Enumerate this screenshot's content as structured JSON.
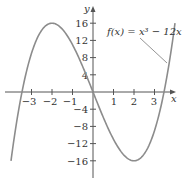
{
  "chart_data": {
    "type": "line",
    "title": "",
    "function_label": "f(x) = x³ − 12x",
    "xlabel": "x",
    "ylabel": "y",
    "xlim": [
      -4.0,
      4.0
    ],
    "ylim": [
      -16,
      16
    ],
    "x_ticks": [
      -3,
      -2,
      -1,
      1,
      2,
      3
    ],
    "y_ticks": [
      -16,
      -12,
      -8,
      -4,
      4,
      8,
      12,
      16
    ],
    "grid": false,
    "series": [
      {
        "name": "f(x) = x³ − 12x",
        "x": [
          -4.0,
          -3.5,
          -3.0,
          -2.5,
          -2.0,
          -1.5,
          -1.0,
          -0.5,
          0,
          0.5,
          1.0,
          1.5,
          2.0,
          2.5,
          3.0,
          3.5,
          4.0
        ],
        "y": [
          -16,
          -0.875,
          9,
          14.375,
          16,
          14.625,
          11,
          5.875,
          0,
          -5.875,
          -11,
          -14.625,
          -16,
          -14.375,
          -9,
          0.875,
          16
        ]
      }
    ],
    "key_points": {
      "local_max": [
        -2,
        16
      ],
      "local_min": [
        2,
        -16
      ],
      "roots": [
        -3.464,
        0,
        3.464
      ]
    }
  },
  "labels": {
    "x_axis": "x",
    "y_axis": "y",
    "function": "f(x) = x³ − 12x",
    "xt": [
      "−3",
      "−2",
      "−1",
      "1",
      "2",
      "3"
    ],
    "yt": [
      "16",
      "12",
      "8",
      "4",
      "−4",
      "−8",
      "−12",
      "−16"
    ]
  },
  "colors": {
    "curve": "#8c8c8c",
    "axis": "#555555",
    "text": "#333333"
  }
}
